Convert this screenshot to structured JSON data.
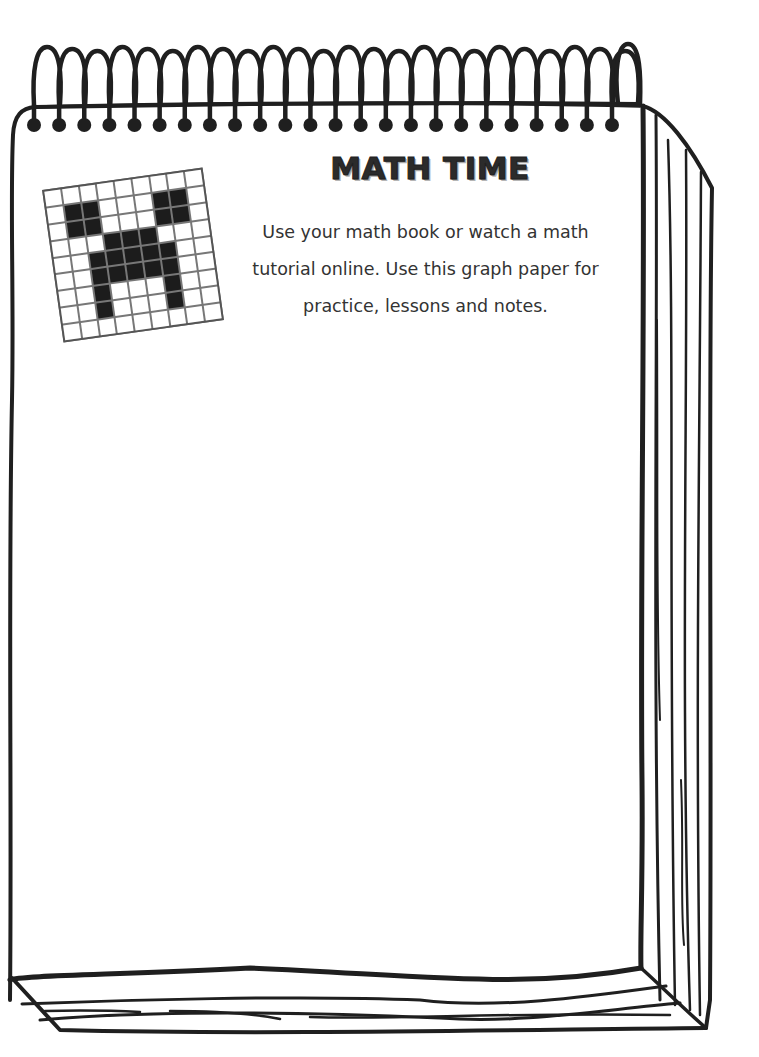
{
  "worksheet": {
    "title": "MATH TIME",
    "instructions": "Use your math book or watch a math tutorial online.  Use this graph paper for practice, lessons and notes.",
    "instruction_lines": [
      "Use your math book or watch a math",
      "tutorial online.  Use this graph paper for",
      "practice, lessons and notes."
    ]
  },
  "illustration": {
    "type": "spiral-notepad",
    "decoration_icon": "creeper-face-grid-icon",
    "creeper_grid": [
      [
        0,
        0,
        0,
        0,
        0,
        0,
        0,
        0,
        0
      ],
      [
        0,
        1,
        1,
        0,
        0,
        0,
        1,
        1,
        0
      ],
      [
        0,
        1,
        1,
        0,
        0,
        0,
        1,
        1,
        0
      ],
      [
        0,
        0,
        0,
        1,
        1,
        1,
        0,
        0,
        0
      ],
      [
        0,
        0,
        1,
        1,
        1,
        1,
        1,
        0,
        0
      ],
      [
        0,
        0,
        1,
        1,
        1,
        1,
        1,
        0,
        0
      ],
      [
        0,
        0,
        1,
        0,
        0,
        0,
        1,
        0,
        0
      ],
      [
        0,
        0,
        1,
        0,
        0,
        0,
        1,
        0,
        0
      ],
      [
        0,
        0,
        0,
        0,
        0,
        0,
        0,
        0,
        0
      ]
    ],
    "spiral_rings": 24
  },
  "colors": {
    "ink": "#1f1f1f",
    "paper": "#ffffff",
    "text": "#333333"
  }
}
